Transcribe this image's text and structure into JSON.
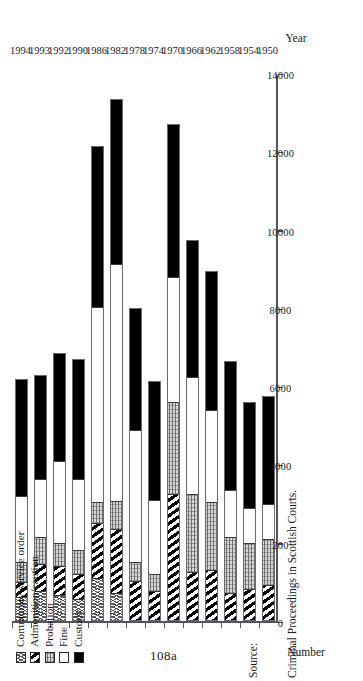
{
  "page": {
    "page_number": "108a",
    "source_label": "Source:",
    "source_text": "Criminal Proceedings in Scottish Courts."
  },
  "chart_data": {
    "type": "bar",
    "orientation": "horizontal-stacked",
    "title": "",
    "xlabel": "Year",
    "ylabel": "Number",
    "ylim": [
      0,
      14000
    ],
    "yticks": [
      "0",
      "200",
      "4000",
      "6000",
      "8000",
      "10000",
      "12000",
      "14000"
    ],
    "ytick_values": [
      0,
      2000,
      4000,
      6000,
      8000,
      10000,
      12000,
      14000
    ],
    "grid": false,
    "legend_position": "top-left",
    "categories": [
      "1950",
      "1954",
      "1958",
      "1962",
      "1966",
      "1970",
      "1974",
      "1978",
      "1982",
      "1986",
      "1990",
      "1992",
      "1993",
      "1994"
    ],
    "series": [
      {
        "name": "Custody",
        "key": "custody",
        "fill": "solid-black",
        "values": [
          2750,
          2700,
          3300,
          3550,
          3500,
          3900,
          3050,
          3100,
          4200,
          4100,
          3050,
          2750,
          2650,
          3000
        ]
      },
      {
        "name": "Fine",
        "key": "fine",
        "fill": "white",
        "values": [
          900,
          900,
          1200,
          2350,
          3000,
          3200,
          1900,
          3400,
          6100,
          5000,
          1850,
          2100,
          1500,
          1700
        ]
      },
      {
        "name": "Probation",
        "key": "probation",
        "fill": "light-stipple",
        "values": [
          1200,
          1200,
          1450,
          1750,
          2000,
          2350,
          450,
          500,
          700,
          550,
          600,
          600,
          700,
          500
        ]
      },
      {
        "name": "Admonition/caution",
        "key": "admonition",
        "fill": "diagonal-stripe",
        "values": [
          900,
          800,
          700,
          1300,
          1250,
          3250,
          750,
          1000,
          1650,
          1400,
          650,
          750,
          700,
          400
        ]
      },
      {
        "name": "Community service order",
        "key": "cso",
        "fill": "cross-stipple",
        "values": [
          0,
          0,
          0,
          0,
          0,
          0,
          0,
          0,
          700,
          1100,
          550,
          650,
          750,
          600
        ]
      }
    ],
    "totals": [
      5750,
      5600,
      6650,
      8950,
      9750,
      12700,
      6150,
      8000,
      13350,
      12150,
      6700,
      6850,
      6300,
      6200
    ]
  },
  "legend": {
    "items": [
      {
        "label": "Community service order",
        "fill": "cross-stipple"
      },
      {
        "label": "Admonition/caution",
        "fill": "diagonal-stripe"
      },
      {
        "label": "Probation",
        "fill": "light-stipple"
      },
      {
        "label": "Fine",
        "fill": "white"
      },
      {
        "label": "Custody",
        "fill": "solid-black"
      }
    ]
  },
  "axes": {
    "value_axis_title": "Number",
    "category_axis_title": "Year"
  }
}
